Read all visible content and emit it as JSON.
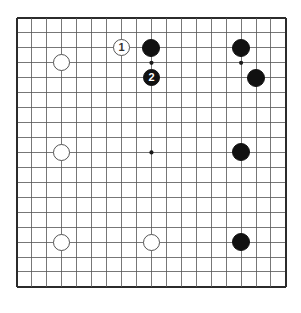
{
  "diagram": {
    "type": "go-board-diagram",
    "board_size": 19,
    "title": "",
    "geometry": {
      "left": 17,
      "top": 18,
      "spacing": 14.94,
      "border_color": "#2b2b2b",
      "line_color": "#555555",
      "background": "#ffffff"
    },
    "star_points": [
      {
        "col": 3,
        "row": 3
      },
      {
        "col": 9,
        "row": 3
      },
      {
        "col": 15,
        "row": 3
      },
      {
        "col": 3,
        "row": 9
      },
      {
        "col": 9,
        "row": 9
      },
      {
        "col": 15,
        "row": 9
      },
      {
        "col": 3,
        "row": 15
      },
      {
        "col": 9,
        "row": 15
      },
      {
        "col": 15,
        "row": 15
      }
    ],
    "stones": [
      {
        "id": "white-top-left-hoshi",
        "color": "white",
        "col": 3,
        "row": 3,
        "label": "",
        "radius": 8.5
      },
      {
        "id": "white-move-1",
        "color": "white",
        "col": 7,
        "row": 2,
        "label": "1",
        "radius": 8.5
      },
      {
        "id": "black-top-center",
        "color": "black",
        "col": 9,
        "row": 2,
        "label": "",
        "radius": 9.0
      },
      {
        "id": "black-move-2",
        "color": "black",
        "col": 9,
        "row": 4,
        "label": "2",
        "radius": 8.5
      },
      {
        "id": "black-top-right-upper",
        "color": "black",
        "col": 15,
        "row": 2,
        "label": "",
        "radius": 9.0
      },
      {
        "id": "black-top-right-lower",
        "color": "black",
        "col": 16,
        "row": 4,
        "label": "",
        "radius": 9.0
      },
      {
        "id": "white-left-hoshi",
        "color": "white",
        "col": 3,
        "row": 9,
        "label": "",
        "radius": 8.5
      },
      {
        "id": "black-right-hoshi",
        "color": "black",
        "col": 15,
        "row": 9,
        "label": "",
        "radius": 9.0
      },
      {
        "id": "white-bottom-left-hoshi",
        "color": "white",
        "col": 3,
        "row": 15,
        "label": "",
        "radius": 8.5
      },
      {
        "id": "white-bottom-center",
        "color": "white",
        "col": 9,
        "row": 15,
        "label": "",
        "radius": 8.5
      },
      {
        "id": "black-bottom-right-hoshi",
        "color": "black",
        "col": 15,
        "row": 15,
        "label": "",
        "radius": 9.0
      }
    ],
    "move_labels": {
      "move_1": "1",
      "move_2": "2"
    }
  }
}
